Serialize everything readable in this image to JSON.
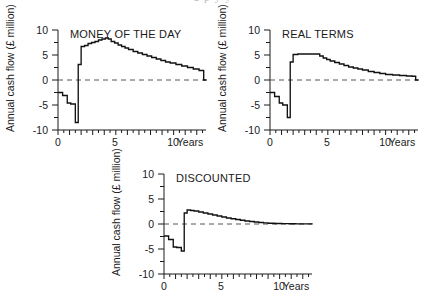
{
  "figure": {
    "bleed_text_top": "a  p      y      y",
    "axis": {
      "ylabel": "Annual cash flow (£ million)",
      "xlabel": "Years",
      "y_ticks": [
        "10",
        "5",
        "0",
        "-5",
        "-10"
      ],
      "y_tick_values": [
        10,
        5,
        0,
        -5,
        -10
      ],
      "x_ticks": [
        "0",
        "5",
        "10"
      ],
      "x_tick_values": [
        0,
        5,
        10
      ],
      "ylim": [
        -10,
        10
      ],
      "xlim": [
        0,
        12.8
      ],
      "y_minor_step": 2.5,
      "x_minor_step": 0.5
    }
  },
  "chart_data": [
    {
      "id": "money-of-the-day",
      "type": "line",
      "title": "MONEY OF THE DAY",
      "xlabel": "Years",
      "ylabel": "Annual cash flow (£ million)",
      "xlim": [
        0,
        12.8
      ],
      "ylim": [
        -10,
        10
      ],
      "xticks": [
        0,
        5,
        10
      ],
      "yticks": [
        -10,
        -5,
        0,
        5,
        10
      ],
      "grid": false,
      "legend": null,
      "zero_reference_line": 0,
      "step_style": "post",
      "x": [
        0.0,
        0.4,
        0.8,
        1.1,
        1.5,
        1.75,
        2.0,
        2.3,
        2.6,
        2.9,
        3.2,
        3.5,
        3.8,
        4.1,
        4.35,
        4.6,
        4.9,
        5.2,
        5.5,
        5.8,
        6.1,
        6.5,
        6.9,
        7.3,
        7.7,
        8.1,
        8.5,
        8.9,
        9.3,
        9.7,
        10.2,
        10.7,
        11.2,
        11.7,
        12.2,
        12.6
      ],
      "values": [
        -2.5,
        -3.1,
        -4.6,
        -4.8,
        -8.5,
        3.1,
        6.7,
        6.9,
        7.3,
        7.5,
        7.7,
        8.0,
        8.2,
        8.4,
        8.2,
        7.7,
        7.4,
        7.0,
        6.7,
        6.4,
        6.1,
        5.7,
        5.4,
        5.1,
        4.8,
        4.5,
        4.2,
        3.9,
        3.6,
        3.4,
        3.1,
        2.8,
        2.5,
        2.2,
        1.9,
        0.0
      ]
    },
    {
      "id": "real-terms",
      "type": "line",
      "title": "REAL TERMS",
      "xlabel": "Years",
      "ylabel": "Annual cash flow (£ million)",
      "xlim": [
        0,
        12.8
      ],
      "ylim": [
        -10,
        10
      ],
      "xticks": [
        0,
        5,
        10
      ],
      "yticks": [
        -10,
        -5,
        0,
        5,
        10
      ],
      "grid": false,
      "legend": null,
      "zero_reference_line": 0,
      "step_style": "post",
      "x": [
        0.0,
        0.4,
        0.8,
        1.1,
        1.5,
        1.75,
        2.0,
        2.4,
        2.8,
        3.2,
        3.6,
        4.0,
        4.3,
        4.6,
        4.9,
        5.2,
        5.6,
        6.0,
        6.4,
        6.8,
        7.2,
        7.6,
        8.0,
        8.5,
        9.0,
        9.5,
        10.0,
        10.6,
        11.2,
        11.8,
        12.3,
        12.6
      ],
      "values": [
        -2.5,
        -3.3,
        -4.6,
        -5.0,
        -7.5,
        3.6,
        5.1,
        5.2,
        5.2,
        5.2,
        5.2,
        5.2,
        4.8,
        4.4,
        4.1,
        3.8,
        3.5,
        3.2,
        2.9,
        2.6,
        2.4,
        2.2,
        2.0,
        1.7,
        1.5,
        1.3,
        1.1,
        1.0,
        0.9,
        0.8,
        0.75,
        0.0
      ]
    },
    {
      "id": "discounted",
      "type": "line",
      "title": "DISCOUNTED",
      "xlabel": "Years",
      "ylabel": "Annual cash flow (£ million)",
      "xlim": [
        0,
        12.8
      ],
      "ylim": [
        -10,
        10
      ],
      "xticks": [
        0,
        5,
        10
      ],
      "yticks": [
        -10,
        -5,
        0,
        5,
        10
      ],
      "grid": false,
      "legend": null,
      "zero_reference_line": 0,
      "step_style": "post",
      "x": [
        0.0,
        0.4,
        0.8,
        1.1,
        1.5,
        1.75,
        2.0,
        2.3,
        2.6,
        3.0,
        3.4,
        3.8,
        4.2,
        4.6,
        5.0,
        5.4,
        5.8,
        6.2,
        6.6,
        7.0,
        7.4,
        7.8,
        8.2,
        8.6,
        9.0,
        9.6,
        10.2,
        10.8,
        11.4,
        12.0,
        12.6
      ],
      "values": [
        -2.4,
        -3.1,
        -4.6,
        -4.7,
        -5.4,
        2.2,
        2.8,
        2.7,
        2.6,
        2.4,
        2.2,
        2.0,
        1.8,
        1.6,
        1.4,
        1.2,
        1.05,
        0.9,
        0.75,
        0.6,
        0.5,
        0.4,
        0.3,
        0.22,
        0.15,
        0.1,
        0.07,
        0.05,
        0.04,
        0.03,
        0.02
      ]
    }
  ]
}
